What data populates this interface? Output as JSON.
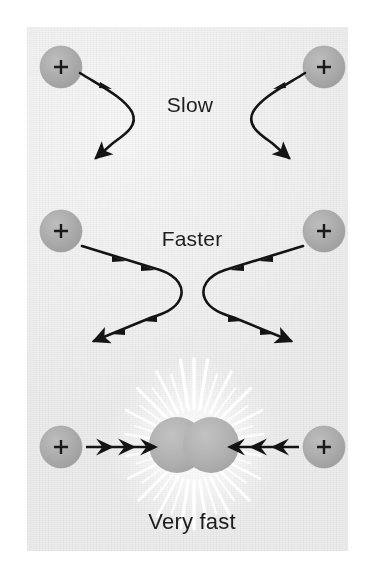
{
  "figure": {
    "background_color": "#ececec",
    "page_color": "#ffffff",
    "particle_fill": "#a9a9a9",
    "particle_stroke": "#9a9a9a",
    "trajectory_color": "#141414",
    "label_color": "#1d1d1d",
    "burst_color": "#ffffff"
  },
  "rows": [
    {
      "id": "slow",
      "label": "Slow",
      "label_x": 190,
      "label_y": 105,
      "description": "Two protons approach slowly and are deflected gently on wide curving paths."
    },
    {
      "id": "faster",
      "label": "Faster",
      "label_x": 192,
      "label_y": 239,
      "description": "Two protons approach faster, come closer together, and scatter through sharper hairpin curves."
    },
    {
      "id": "very-fast",
      "label": "Very fast",
      "label_x": 192,
      "label_y": 522,
      "description": "Two protons collide head on at very high speed, touching and producing a burst of radiating light."
    }
  ],
  "particles": [
    {
      "id": "slow-left",
      "symbol": "+",
      "cx": 61,
      "cy": 67,
      "r": 21
    },
    {
      "id": "slow-right",
      "symbol": "+",
      "cx": 324,
      "cy": 67,
      "r": 21
    },
    {
      "id": "faster-left",
      "symbol": "+",
      "cx": 61,
      "cy": 231,
      "r": 21
    },
    {
      "id": "faster-right",
      "symbol": "+",
      "cx": 324,
      "cy": 231,
      "r": 21
    },
    {
      "id": "veryfast-left",
      "symbol": "+",
      "cx": 61,
      "cy": 447,
      "r": 21
    },
    {
      "id": "veryfast-right",
      "symbol": "+",
      "cx": 324,
      "cy": 447,
      "r": 21
    },
    {
      "id": "collision-a",
      "symbol": "",
      "cx": 177,
      "cy": 445,
      "r": 28
    },
    {
      "id": "collision-b",
      "symbol": "",
      "cx": 211,
      "cy": 445,
      "r": 28
    }
  ],
  "arrows": {
    "very_fast_left_count": 3,
    "very_fast_right_count": 3,
    "very_fast_left_direction": "right",
    "very_fast_right_direction": "left"
  },
  "burst": {
    "ray_count": 40,
    "center_x": 194,
    "center_y": 445,
    "inner_radius": 34,
    "outer_radius": 88
  }
}
